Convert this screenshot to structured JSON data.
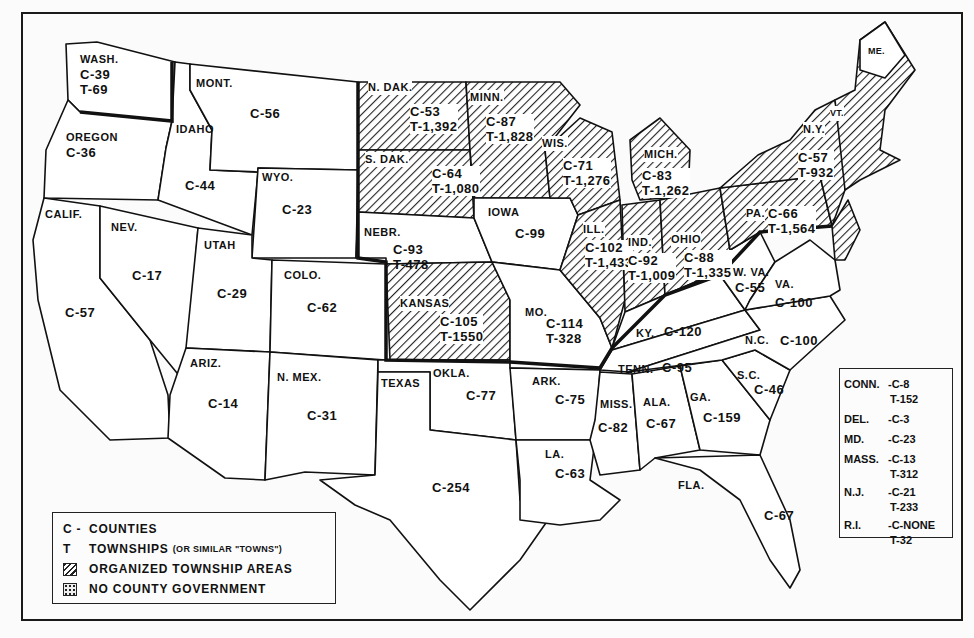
{
  "map": {
    "title": "",
    "states": [
      {
        "id": "wash",
        "name": "WASH.",
        "counties": "C-39",
        "townships": "T-69",
        "x": 90,
        "y": 60
      },
      {
        "id": "oregon",
        "name": "OREGON",
        "counties": "C-36",
        "x": 66,
        "y": 132
      },
      {
        "id": "idaho",
        "name": "IDAHO",
        "counties": "C-44",
        "x": 176,
        "y": 125
      },
      {
        "id": "mont",
        "name": "MONT.",
        "counties": "C-56",
        "x": 196,
        "y": 76
      },
      {
        "id": "wyo",
        "name": "WYO.",
        "counties": "C-23",
        "x": 262,
        "y": 176
      },
      {
        "id": "calif",
        "name": "CALIF.",
        "counties": "C-57",
        "x": 45,
        "y": 208
      },
      {
        "id": "nev",
        "name": "NEV.",
        "counties": "C-17",
        "x": 111,
        "y": 222
      },
      {
        "id": "utah",
        "name": "UTAH",
        "counties": "C-29",
        "x": 204,
        "y": 240
      },
      {
        "id": "colo",
        "name": "COLO.",
        "counties": "C-62",
        "x": 284,
        "y": 270
      },
      {
        "id": "ariz",
        "name": "ARIZ.",
        "counties": "C-14",
        "x": 190,
        "y": 358
      },
      {
        "id": "nmex",
        "name": "N. MEX.",
        "counties": "C-31",
        "x": 277,
        "y": 372
      },
      {
        "id": "ndak",
        "name": "N. DAK.",
        "counties": "C-53",
        "townships": "T-1,392",
        "x": 366,
        "y": 84
      },
      {
        "id": "sdak",
        "name": "S. DAK.",
        "counties": "C-64",
        "townships": "T-1,080",
        "x": 365,
        "y": 152
      },
      {
        "id": "nebr",
        "name": "NEBR.",
        "counties": "C-93",
        "townships": "T-478",
        "x": 364,
        "y": 225
      },
      {
        "id": "kansas",
        "name": "KANSAS",
        "counties": "C-105",
        "townships": "T-1550",
        "x": 400,
        "y": 297
      },
      {
        "id": "okla",
        "name": "OKLA.",
        "counties": "C-77",
        "x": 433,
        "y": 368
      },
      {
        "id": "texas",
        "name": "TEXAS",
        "counties": "C-254",
        "x": 381,
        "y": 378
      },
      {
        "id": "minn",
        "name": "MINN.",
        "counties": "C-87",
        "townships": "T-1,828",
        "x": 470,
        "y": 92
      },
      {
        "id": "iowa",
        "name": "IOWA",
        "counties": "C-99",
        "x": 488,
        "y": 207
      },
      {
        "id": "mo",
        "name": "MO.",
        "counties": "C-114",
        "townships": "T-328",
        "x": 525,
        "y": 307
      },
      {
        "id": "ark",
        "name": "ARK.",
        "counties": "C-75",
        "x": 532,
        "y": 375
      },
      {
        "id": "la",
        "name": "LA.",
        "counties": "C-63",
        "x": 545,
        "y": 447
      },
      {
        "id": "wis",
        "name": "WIS.",
        "counties": "C-71",
        "townships": "T-1,276",
        "x": 542,
        "y": 138
      },
      {
        "id": "ill",
        "name": "ILL.",
        "counties": "C-102",
        "townships": "T-1,433",
        "x": 583,
        "y": 222
      },
      {
        "id": "mich",
        "name": "MICH.",
        "counties": "C-83",
        "townships": "T-1,262",
        "x": 644,
        "y": 148
      },
      {
        "id": "ind",
        "name": "IND.",
        "counties": "C-92",
        "townships": "T-1,009",
        "x": 628,
        "y": 228
      },
      {
        "id": "ohio",
        "name": "OHIO",
        "counties": "C-88",
        "townships": "T-1,335",
        "x": 670,
        "y": 228
      },
      {
        "id": "ky",
        "name": "KY.",
        "counties": "C-120",
        "x": 634,
        "y": 328
      },
      {
        "id": "tenn",
        "name": "TENN.",
        "counties": "C-95",
        "x": 622,
        "y": 364
      },
      {
        "id": "miss",
        "name": "MISS.",
        "counties": "C-82",
        "x": 601,
        "y": 396
      },
      {
        "id": "ala",
        "name": "ALA.",
        "counties": "C-67",
        "x": 642,
        "y": 394
      },
      {
        "id": "ga",
        "name": "GA.",
        "counties": "C-159",
        "x": 690,
        "y": 390
      },
      {
        "id": "fla",
        "name": "FLA.",
        "counties": "C-67",
        "x": 678,
        "y": 479
      },
      {
        "id": "sc",
        "name": "S.C.",
        "counties": "C-46",
        "x": 738,
        "y": 368
      },
      {
        "id": "nc",
        "name": "N.C.",
        "counties": "C-100",
        "x": 745,
        "y": 334
      },
      {
        "id": "wva",
        "name": "W. VA.",
        "counties": "C-55",
        "x": 730,
        "y": 262
      },
      {
        "id": "va",
        "name": "VA.",
        "counties": "C-100",
        "x": 775,
        "y": 279
      },
      {
        "id": "pa",
        "name": "PA.",
        "counties": "C-66",
        "townships": "T-1,564",
        "x": 745,
        "y": 204
      },
      {
        "id": "ny",
        "name": "N.Y.",
        "counties": "C-57",
        "townships": "T-932",
        "x": 793,
        "y": 122
      },
      {
        "id": "vt",
        "name": "VT.",
        "x": 835,
        "y": 106
      },
      {
        "id": "me",
        "name": "ME.",
        "x": 872,
        "y": 46
      }
    ],
    "inset_small_states": [
      {
        "name": "CONN.",
        "counties": "C-8",
        "townships": "T-152"
      },
      {
        "name": "DEL.",
        "counties": "C-3"
      },
      {
        "name": "MD.",
        "counties": "C-23"
      },
      {
        "name": "MASS.",
        "counties": "C-13",
        "townships": "T-312"
      },
      {
        "name": "N.J.",
        "counties": "C-21",
        "townships": "T-233"
      },
      {
        "name": "R.I.",
        "counties": "C-NONE",
        "townships": "T-32"
      }
    ]
  },
  "legend": {
    "items": [
      {
        "key": "C -",
        "label": "COUNTIES"
      },
      {
        "key": "T",
        "label": "TOWNSHIPS",
        "note": "(OR SIMILAR \"TOWNS\")"
      },
      {
        "key": "hatch",
        "label": "ORGANIZED TOWNSHIP AREAS"
      },
      {
        "key": "dots",
        "label": "NO COUNTY GOVERNMENT"
      }
    ]
  },
  "colors": {
    "ink": "#111111",
    "paper": "#fbfbfb"
  }
}
